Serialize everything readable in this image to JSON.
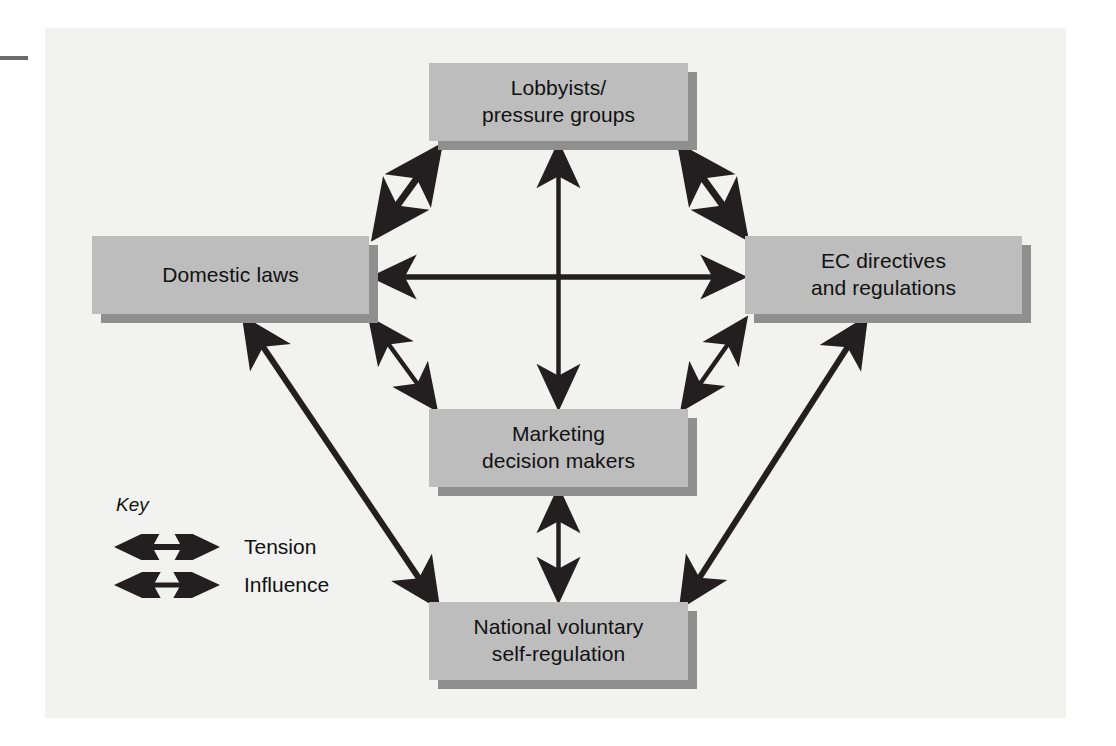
{
  "figure": {
    "background_color": "#f2f2f0",
    "node_fill": "#bdbdbd",
    "node_shadow": "#8f8f8f",
    "arrow_color": "#231f20"
  },
  "nodes": {
    "lobbyists": {
      "label": "Lobbyists/\npressure groups"
    },
    "domestic": {
      "label": "Domestic laws"
    },
    "ec": {
      "label": "EC directives\nand regulations"
    },
    "marketing": {
      "label": "Marketing\ndecision makers"
    },
    "national": {
      "label": "National voluntary\nself-regulation"
    }
  },
  "key": {
    "title": "Key",
    "items": [
      {
        "label": "Tension",
        "style": "thick-double-arrow"
      },
      {
        "label": "Influence",
        "style": "thin-double-arrow"
      }
    ]
  },
  "connections": [
    {
      "from": "domestic",
      "to": "lobbyists",
      "type": "Tension"
    },
    {
      "from": "lobbyists",
      "to": "ec",
      "type": "Tension"
    },
    {
      "from": "lobbyists",
      "to": "marketing",
      "type": "Influence"
    },
    {
      "from": "domestic",
      "to": "ec",
      "type": "Tension"
    },
    {
      "from": "domestic",
      "to": "marketing",
      "type": "Influence"
    },
    {
      "from": "ec",
      "to": "marketing",
      "type": "Influence"
    },
    {
      "from": "marketing",
      "to": "national",
      "type": "Influence"
    },
    {
      "from": "domestic",
      "to": "national",
      "type": "Tension"
    },
    {
      "from": "ec",
      "to": "national",
      "type": "Tension"
    }
  ]
}
